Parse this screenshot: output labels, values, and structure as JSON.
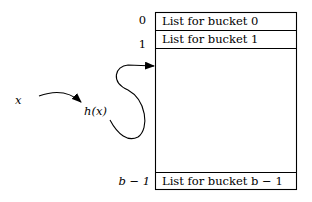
{
  "diagram": {
    "input_label": "x",
    "hash_label": "h(x)",
    "buckets": [
      {
        "index": "0",
        "label": "List for bucket 0"
      },
      {
        "index": "1",
        "label": "List for bucket 1"
      },
      {
        "index": "b − 1",
        "label": "List for bucket b − 1"
      }
    ]
  }
}
